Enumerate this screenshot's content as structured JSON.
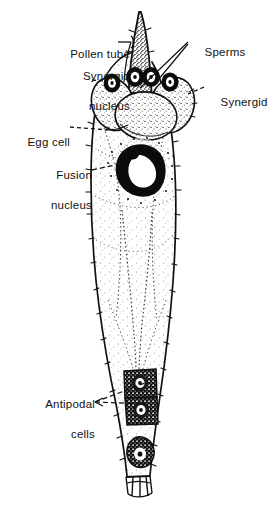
{
  "figure": {
    "background_color": "#ffffff",
    "ink_color": "#111111"
  },
  "labels": [
    {
      "id": "pollen-tube",
      "text": "Pollen tube",
      "line1": "Pollen tube",
      "line2": "",
      "align": "right",
      "x": 52,
      "y": 33,
      "width": 78,
      "leader": "bracket"
    },
    {
      "id": "synergid-nucleus",
      "text": "Synergid nucleus",
      "line1": "Synergid",
      "line2": "nucleus",
      "align": "right",
      "x": 33,
      "y": 54,
      "width": 97,
      "leader": "dashed"
    },
    {
      "id": "sperms",
      "text": "Sperms",
      "line1": "Sperms",
      "line2": "",
      "align": "left",
      "x": 191,
      "y": 31,
      "width": 60,
      "leader": "solid-double"
    },
    {
      "id": "synergid",
      "text": "Synergid",
      "line1": "Synergid",
      "line2": "",
      "align": "left",
      "x": 207,
      "y": 81,
      "width": 62,
      "leader": "dashed"
    },
    {
      "id": "egg-cell",
      "text": "Egg cell",
      "line1": "Egg cell",
      "line2": "",
      "align": "right",
      "x": 17,
      "y": 122,
      "width": 60,
      "leader": "dashed"
    },
    {
      "id": "fusion-nucleus",
      "text": "Fusion nucleus",
      "line1": "Fusion",
      "line2": "nucleus",
      "align": "right",
      "x": 25,
      "y": 153,
      "width": 75,
      "leader": "dashed"
    },
    {
      "id": "antipodal-cells",
      "text": "Antipodal cells",
      "line1": "Antipodal",
      "line2": "cells",
      "align": "right",
      "x": 18,
      "y": 382,
      "width": 82,
      "leader": "dashed-fork"
    }
  ],
  "structures": [
    {
      "id": "pollen-tube-body",
      "name": "pollen tube",
      "description": "narrow tapering tube entering from top, densely stippled"
    },
    {
      "id": "sperm-nucleus-left",
      "name": "sperm nucleus",
      "description": "dark ringed nucleus inside pollen tube"
    },
    {
      "id": "sperm-nucleus-right",
      "name": "sperm nucleus",
      "description": "dark ringed nucleus inside pollen tube"
    },
    {
      "id": "synergid-left",
      "name": "synergid",
      "description": "left flanking cell with dark nucleus"
    },
    {
      "id": "synergid-right",
      "name": "synergid",
      "description": "right flanking cell with dark nucleus"
    },
    {
      "id": "egg-cell-body",
      "name": "egg cell",
      "description": "large central cell below the synergids"
    },
    {
      "id": "fusion-nucleus-body",
      "name": "fusion nucleus",
      "description": "large dark nucleus mid-sac, heavily stippled"
    },
    {
      "id": "embryo-sac-wall",
      "name": "embryo sac wall",
      "description": "tapering outline with fine tick marks"
    },
    {
      "id": "antipodal-cell-upper",
      "name": "antipodal cell",
      "description": "dark rectangular cell near base"
    },
    {
      "id": "antipodal-cell-lower",
      "name": "antipodal cell",
      "description": "dark rectangular cell near base"
    },
    {
      "id": "basal-nucleus",
      "name": "basal nucleus",
      "description": "small stippled nucleus below antipodals"
    },
    {
      "id": "basal-cells",
      "name": "basal cell layer",
      "description": "row of small polygonal cells at very bottom"
    }
  ]
}
